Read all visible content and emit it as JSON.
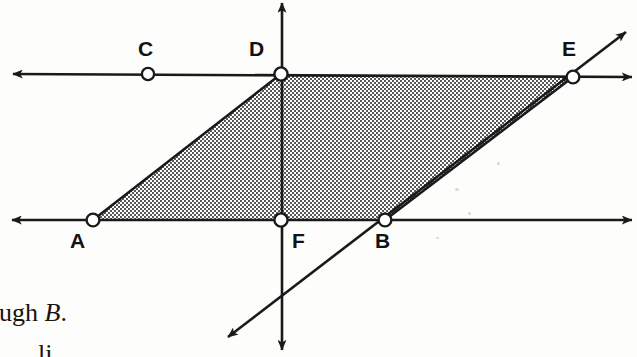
{
  "figure": {
    "background_color": "#fdfdfb",
    "ink_color": "#1a1a1a",
    "shade_color": "#8d8d8d",
    "width": 637,
    "height": 357
  },
  "points": [
    {
      "id": "A",
      "label": "A",
      "x": 93,
      "y": 220,
      "label_x": 70,
      "label_y": 230,
      "marker": "open-circle"
    },
    {
      "id": "B",
      "label": "B",
      "x": 385,
      "y": 220,
      "label_x": 375,
      "label_y": 230,
      "marker": "open-circle"
    },
    {
      "id": "C",
      "label": "C",
      "x": 148,
      "y": 74,
      "label_x": 138,
      "label_y": 38,
      "marker": "open-circle"
    },
    {
      "id": "D",
      "label": "D",
      "x": 281,
      "y": 74,
      "label_x": 249,
      "label_y": 38,
      "marker": "open-circle"
    },
    {
      "id": "E",
      "label": "E",
      "x": 573,
      "y": 77,
      "label_x": 562,
      "label_y": 38,
      "marker": "open-circle"
    },
    {
      "id": "F",
      "label": "F",
      "x": 281,
      "y": 220,
      "label_x": 292,
      "label_y": 230,
      "marker": "open-circle"
    }
  ],
  "shaded_region": {
    "name": "parallelogram-ADEB",
    "vertices": [
      "A",
      "D",
      "E",
      "B"
    ],
    "fill": "halftone-checker-gray",
    "path": "M 93,220 L 281,74 L 573,77 L 385,220 Z"
  },
  "lines": [
    {
      "id": "line-CD-E",
      "name": "upper-horizontal-line",
      "through": [
        "C",
        "D",
        "E"
      ],
      "x1": 13,
      "y1": 74,
      "x2": 632,
      "y2": 77,
      "arrow_start": true,
      "arrow_end": true
    },
    {
      "id": "line-AFB",
      "name": "lower-horizontal-line",
      "through": [
        "A",
        "F",
        "B"
      ],
      "x1": 12,
      "y1": 220,
      "x2": 632,
      "y2": 220,
      "arrow_start": true,
      "arrow_end": true
    },
    {
      "id": "line-DF",
      "name": "vertical-line",
      "through": [
        "D",
        "F"
      ],
      "x1": 282,
      "y1": 3,
      "x2": 282,
      "y2": 350,
      "arrow_start": true,
      "arrow_end": true
    },
    {
      "id": "line-BE",
      "name": "diagonal-line-through-B-and-E",
      "through": [
        "B",
        "E"
      ],
      "x1": 228,
      "y1": 337,
      "x2": 626,
      "y2": 32,
      "arrow_start": true,
      "arrow_end": true
    }
  ],
  "caption": {
    "line1_prefix": "ough ",
    "line1_italic": "B",
    "line1_suffix": ".",
    "line2": "li",
    "note": "text is cropped at the left page margin"
  }
}
